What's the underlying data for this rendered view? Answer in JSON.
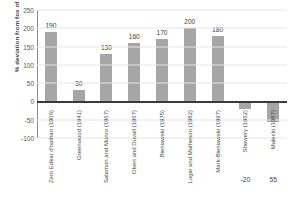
{
  "chart_data": {
    "type": "bar",
    "title": "",
    "xlabel": "",
    "ylabel": "% deviation from fos of 1.0",
    "ylim": [
      -100,
      250
    ],
    "yticks": [
      250,
      200,
      150,
      100,
      50,
      0,
      -50,
      -100
    ],
    "grid": true,
    "legend": "none",
    "categories": [
      "Zern Edkar d'nathan (1906)",
      "Greenwood (1941)",
      "Salamon and Munro (1967)",
      "Obert and Duvall (1967)",
      "Bieniawski (1975)",
      "Logie and Matheson (1982)",
      "Mark-Bieniawski (1997)",
      "Shewery (1962)",
      "Malecki (1987)"
    ],
    "values": [
      190,
      30,
      130,
      160,
      170,
      200,
      180,
      -20,
      -55
    ],
    "value_labels": [
      "190",
      "30",
      "130",
      "160",
      "170",
      "200",
      "180",
      "-20",
      "55"
    ],
    "bar_color": "#a6a6a6",
    "gridline_color": "#e6e6e6",
    "zero_line_color": "#3a3a3a"
  }
}
